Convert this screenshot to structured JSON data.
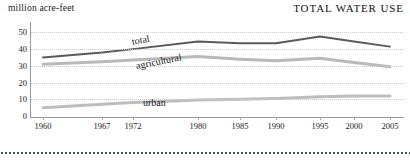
{
  "chart_data": {
    "type": "line",
    "title": "TOTAL WATER USE",
    "ylabel": "million acre-feet",
    "xlabel": "",
    "ylim": [
      0,
      55
    ],
    "yticks": [
      0,
      10,
      20,
      30,
      40,
      50
    ],
    "grid": true,
    "legend_position": "inline-labels",
    "x": [
      1960,
      1967,
      1972,
      1980,
      1985,
      1990,
      1995,
      2000,
      2005
    ],
    "xticklabels": [
      "1960",
      "1967",
      "1972",
      "1980",
      "1985",
      "1990",
      "1995",
      "2000",
      "2005"
    ],
    "series": [
      {
        "name": "total",
        "color": "#5a5a5a",
        "values": [
          35,
          38,
          40,
          44.5,
          43.5,
          43.5,
          47.5,
          44.5,
          41.5
        ]
      },
      {
        "name": "agricultural",
        "color": "#b9b9b9",
        "values": [
          31,
          32.5,
          33.5,
          35.5,
          34,
          33,
          34.5,
          32,
          29.5
        ]
      },
      {
        "name": "urban",
        "color": "#bdbdbd",
        "values": [
          5,
          7,
          8,
          9.5,
          10,
          10.5,
          11.5,
          12,
          12
        ]
      }
    ],
    "annotations": [
      {
        "text": "total",
        "series": "total"
      },
      {
        "text": "agricultural",
        "series": "agricultural"
      },
      {
        "text": "urban",
        "series": "urban"
      }
    ]
  }
}
